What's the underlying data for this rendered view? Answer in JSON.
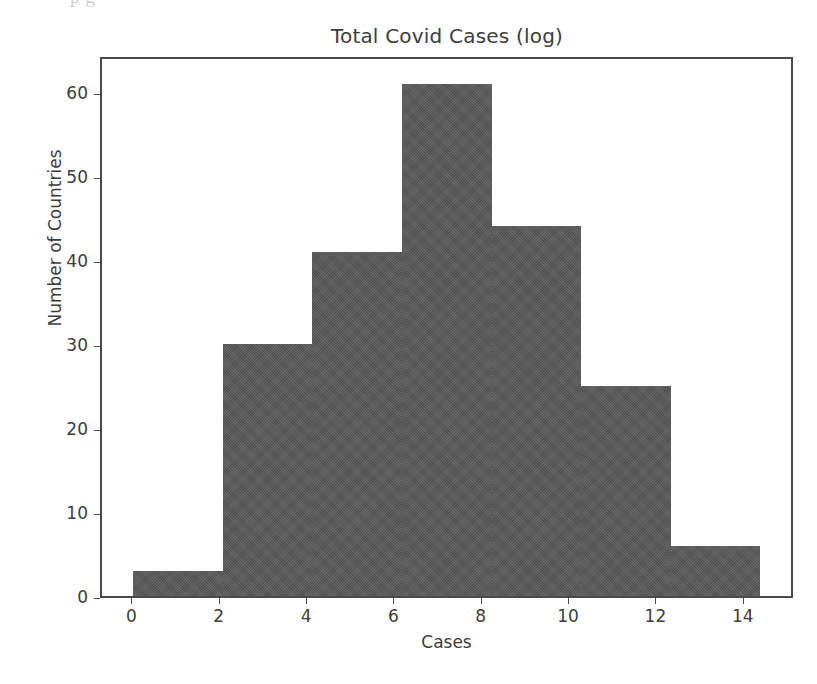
{
  "scan_artifact": {
    "text": "p                 g"
  },
  "chart_data": {
    "type": "bar",
    "title": "Total Covid Cases (log)",
    "xlabel": "Cases",
    "ylabel": "Number of Countries",
    "grid": false,
    "legend": "none",
    "bar_color": "#595959",
    "edge_color": "#4a4a4a",
    "background_color": "#ffffff",
    "xlim": [
      -0.72,
      15.15
    ],
    "ylim": [
      0,
      64.4
    ],
    "xticks": [
      0,
      2,
      4,
      6,
      8,
      10,
      12,
      14
    ],
    "xtick_labels": [
      "0",
      "2",
      "4",
      "6",
      "8",
      "10",
      "12",
      "14"
    ],
    "yticks": [
      0,
      10,
      20,
      30,
      40,
      50,
      60
    ],
    "ytick_labels": [
      "0",
      "10",
      "20",
      "30",
      "40",
      "50",
      "60"
    ],
    "bin_edges": [
      0.0,
      2.05,
      4.1,
      6.15,
      8.2,
      10.25,
      12.3,
      14.35
    ],
    "categories": [
      "0.0-2.05",
      "2.05-4.1",
      "4.1-6.15",
      "6.15-8.2",
      "8.2-10.25",
      "10.25-12.3",
      "12.3-14.35"
    ],
    "values": [
      3,
      30,
      41,
      61,
      44,
      25,
      6
    ]
  }
}
